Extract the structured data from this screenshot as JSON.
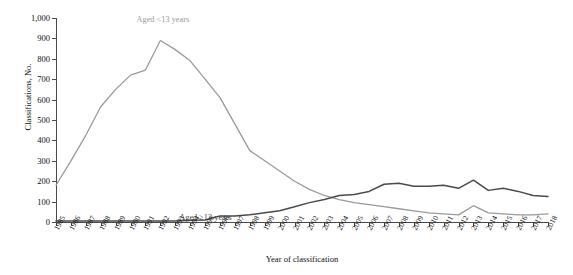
{
  "chart_data": {
    "type": "line",
    "title": "",
    "xlabel": "Year of classification",
    "ylabel": "Classifications, No.",
    "ylim": [
      0,
      1000
    ],
    "ytick_labels": [
      "0",
      "100",
      "200",
      "300",
      "400",
      "500",
      "600",
      "700",
      "800",
      "900",
      "1,000"
    ],
    "ytick_values": [
      0,
      100,
      200,
      300,
      400,
      500,
      600,
      700,
      800,
      900,
      1000
    ],
    "grid": false,
    "legend_position": "inline-annotations",
    "categories": [
      "1985",
      "1986",
      "1987",
      "1988",
      "1989",
      "1990",
      "1991",
      "1992",
      "1993",
      "1994",
      "1995",
      "1996",
      "1997",
      "1998",
      "1999",
      "2000",
      "2001",
      "2002",
      "2003",
      "2004",
      "2005",
      "2006",
      "2007",
      "2008",
      "2009",
      "2010",
      "2011",
      "2012",
      "2013",
      "2014",
      "2015",
      "2016",
      "2017",
      "2018"
    ],
    "x": [
      1985,
      1986,
      1987,
      1988,
      1989,
      1990,
      1991,
      1992,
      1993,
      1994,
      1995,
      1996,
      1997,
      1998,
      1999,
      2000,
      2001,
      2002,
      2003,
      2004,
      2005,
      2006,
      2007,
      2008,
      2009,
      2010,
      2011,
      2012,
      2013,
      2014,
      2015,
      2016,
      2017,
      2018
    ],
    "series": [
      {
        "name": "Aged <13 years",
        "color": "#9a9a9a",
        "values": [
          180,
          300,
          425,
          565,
          650,
          720,
          745,
          890,
          845,
          790,
          700,
          610,
          480,
          350,
          300,
          250,
          200,
          160,
          130,
          110,
          95,
          85,
          75,
          65,
          55,
          45,
          40,
          35,
          80,
          45,
          40,
          35,
          35,
          40
        ]
      },
      {
        "name": "Aged ≥13 years",
        "color": "#4a4a4a",
        "values": [
          5,
          5,
          5,
          5,
          5,
          5,
          5,
          5,
          5,
          8,
          10,
          30,
          30,
          35,
          45,
          55,
          75,
          95,
          110,
          130,
          135,
          150,
          185,
          190,
          175,
          175,
          180,
          165,
          205,
          155,
          165,
          150,
          130,
          125
        ]
      }
    ],
    "annotations": [
      {
        "text": "Aged <13 years",
        "series": "Aged <13 years"
      },
      {
        "text": "Aged ≥13 years",
        "series": "Aged ≥13 years"
      }
    ]
  },
  "axis": {
    "y_title": "Classifications, No.",
    "x_title": "Year of classification"
  }
}
